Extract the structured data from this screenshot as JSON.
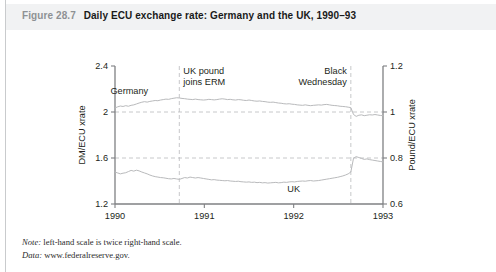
{
  "figure": {
    "number": "Figure 28.7",
    "caption": "Daily ECU exchange rate: Germany and the UK, 1990–93"
  },
  "notes": [
    {
      "label": "Note:",
      "text": " left-hand scale is twice right-hand scale."
    },
    {
      "label": "Data:",
      "text": " www.federalreserve.gov."
    }
  ],
  "colors": {
    "banner": "#f1f2f3",
    "axis": "#7f8083",
    "series": "#b9babc",
    "grid": "#b9babc",
    "text": "#231f20",
    "fignum": "#8e9194"
  },
  "chart_data": {
    "type": "line",
    "title": "Daily ECU exchange rate: Germany and the UK, 1990–93",
    "xlabel": "",
    "ylabel": "DM/ECU xrate",
    "y2label": "Pound/ECU xrate",
    "grid": true,
    "gridlines_y": [
      2.0,
      1.6
    ],
    "legend": "inline-labels",
    "xlim": [
      1990.0,
      1993.0
    ],
    "ylim": [
      1.2,
      2.4
    ],
    "y2lim": [
      0.6,
      1.2
    ],
    "xticks": [
      "1990",
      "1991",
      "1992",
      "1993"
    ],
    "xtick_values": [
      1990,
      1991,
      1992,
      1993
    ],
    "yticks": [
      "2.4",
      "2",
      "1.6",
      "1.2"
    ],
    "ytick_values": [
      2.4,
      2.0,
      1.6,
      1.2
    ],
    "y2ticks": [
      "1.2",
      "1",
      "0.8",
      "0.6"
    ],
    "y2tick_values": [
      1.2,
      1.0,
      0.8,
      0.6
    ],
    "annotations": [
      {
        "text": "UK pound\njoins ERM",
        "line1": "UK pound",
        "line2": "joins ERM",
        "x": 1990.72,
        "align": "left"
      },
      {
        "text": "Black\nWednesday",
        "line1": "Black",
        "line2": "Wednesday",
        "x": 1992.64,
        "align": "right"
      }
    ],
    "vlines": [
      1990.72,
      1992.64
    ],
    "series": [
      {
        "name": "Germany",
        "label": "Germany",
        "label_x": 1990.16,
        "label_y": 2.16,
        "x": [
          1990.0,
          1990.03,
          1990.06,
          1990.09,
          1990.12,
          1990.15,
          1990.18,
          1990.21,
          1990.24,
          1990.27,
          1990.3,
          1990.33,
          1990.36,
          1990.39,
          1990.42,
          1990.45,
          1990.48,
          1990.51,
          1990.54,
          1990.57,
          1990.6,
          1990.63,
          1990.66,
          1990.69,
          1990.72,
          1990.75,
          1990.78,
          1990.81,
          1990.84,
          1990.87,
          1990.9,
          1990.93,
          1990.96,
          1990.99,
          1991.02,
          1991.05,
          1991.08,
          1991.11,
          1991.14,
          1991.17,
          1991.2,
          1991.23,
          1991.26,
          1991.29,
          1991.32,
          1991.35,
          1991.38,
          1991.41,
          1991.44,
          1991.47,
          1991.5,
          1991.53,
          1991.56,
          1991.59,
          1991.62,
          1991.65,
          1991.68,
          1991.71,
          1991.74,
          1991.77,
          1991.8,
          1991.83,
          1991.86,
          1991.89,
          1991.92,
          1991.95,
          1991.98,
          1992.01,
          1992.04,
          1992.07,
          1992.1,
          1992.13,
          1992.16,
          1992.19,
          1992.22,
          1992.25,
          1992.28,
          1992.31,
          1992.34,
          1992.37,
          1992.4,
          1992.43,
          1992.46,
          1992.49,
          1992.52,
          1992.55,
          1992.58,
          1992.61,
          1992.64,
          1992.67,
          1992.7,
          1992.73,
          1992.76,
          1992.79,
          1992.82,
          1992.85,
          1992.88,
          1992.91,
          1992.94,
          1992.97,
          1993.0
        ],
        "y": [
          2.035,
          2.045,
          2.052,
          2.048,
          2.055,
          2.05,
          2.058,
          2.062,
          2.07,
          2.078,
          2.085,
          2.09,
          2.086,
          2.092,
          2.096,
          2.1,
          2.098,
          2.104,
          2.108,
          2.112,
          2.11,
          2.116,
          2.12,
          2.124,
          2.122,
          2.118,
          2.116,
          2.112,
          2.11,
          2.108,
          2.112,
          2.108,
          2.106,
          2.104,
          2.106,
          2.11,
          2.108,
          2.105,
          2.108,
          2.112,
          2.115,
          2.112,
          2.108,
          2.11,
          2.106,
          2.104,
          2.108,
          2.106,
          2.102,
          2.1,
          2.104,
          2.1,
          2.096,
          2.094,
          2.096,
          2.092,
          2.09,
          2.086,
          2.084,
          2.086,
          2.082,
          2.078,
          2.076,
          2.072,
          2.07,
          2.072,
          2.068,
          2.066,
          2.062,
          2.06,
          2.058,
          2.062,
          2.058,
          2.055,
          2.058,
          2.06,
          2.062,
          2.06,
          2.064,
          2.066,
          2.062,
          2.058,
          2.056,
          2.054,
          2.05,
          2.048,
          2.046,
          2.042,
          2.038,
          1.978,
          1.962,
          1.972,
          1.975,
          1.968,
          1.972,
          1.976,
          1.974,
          1.978,
          1.974,
          1.97,
          1.968
        ]
      },
      {
        "name": "UK",
        "label": "UK",
        "label_x": 1992.0,
        "label_y": 1.305,
        "x": [
          1990.0,
          1990.03,
          1990.06,
          1990.09,
          1990.12,
          1990.15,
          1990.18,
          1990.21,
          1990.24,
          1990.27,
          1990.3,
          1990.33,
          1990.36,
          1990.39,
          1990.42,
          1990.45,
          1990.48,
          1990.51,
          1990.54,
          1990.57,
          1990.6,
          1990.63,
          1990.66,
          1990.69,
          1990.72,
          1990.75,
          1990.78,
          1990.81,
          1990.84,
          1990.87,
          1990.9,
          1990.93,
          1990.96,
          1990.99,
          1991.02,
          1991.05,
          1991.08,
          1991.11,
          1991.14,
          1991.17,
          1991.2,
          1991.23,
          1991.26,
          1991.29,
          1991.32,
          1991.35,
          1991.38,
          1991.41,
          1991.44,
          1991.47,
          1991.5,
          1991.53,
          1991.56,
          1991.59,
          1991.62,
          1991.65,
          1991.68,
          1991.71,
          1991.74,
          1991.77,
          1991.8,
          1991.83,
          1991.86,
          1991.89,
          1991.92,
          1991.95,
          1991.98,
          1992.01,
          1992.04,
          1992.07,
          1992.1,
          1992.13,
          1992.16,
          1992.19,
          1992.22,
          1992.25,
          1992.28,
          1992.31,
          1992.34,
          1992.37,
          1992.4,
          1992.43,
          1992.46,
          1992.49,
          1992.52,
          1992.55,
          1992.58,
          1992.61,
          1992.64,
          1992.67,
          1992.7,
          1992.73,
          1992.76,
          1992.79,
          1992.82,
          1992.85,
          1992.88,
          1992.91,
          1992.94,
          1992.97,
          1993.0
        ],
        "y": [
          1.478,
          1.47,
          1.462,
          1.468,
          1.472,
          1.482,
          1.492,
          1.486,
          1.494,
          1.488,
          1.478,
          1.47,
          1.462,
          1.452,
          1.444,
          1.438,
          1.434,
          1.43,
          1.428,
          1.424,
          1.42,
          1.418,
          1.422,
          1.418,
          1.414,
          1.422,
          1.43,
          1.426,
          1.434,
          1.43,
          1.426,
          1.43,
          1.426,
          1.422,
          1.418,
          1.414,
          1.41,
          1.412,
          1.408,
          1.406,
          1.404,
          1.402,
          1.404,
          1.4,
          1.398,
          1.396,
          1.398,
          1.394,
          1.392,
          1.39,
          1.392,
          1.388,
          1.39,
          1.386,
          1.388,
          1.384,
          1.386,
          1.382,
          1.384,
          1.386,
          1.388,
          1.384,
          1.386,
          1.39,
          1.388,
          1.392,
          1.394,
          1.392,
          1.396,
          1.398,
          1.4,
          1.398,
          1.402,
          1.404,
          1.4,
          1.402,
          1.404,
          1.408,
          1.412,
          1.416,
          1.42,
          1.424,
          1.428,
          1.432,
          1.438,
          1.444,
          1.452,
          1.462,
          1.478,
          1.598,
          1.612,
          1.604,
          1.596,
          1.588,
          1.592,
          1.586,
          1.582,
          1.578,
          1.574,
          1.57,
          1.566
        ]
      }
    ]
  }
}
